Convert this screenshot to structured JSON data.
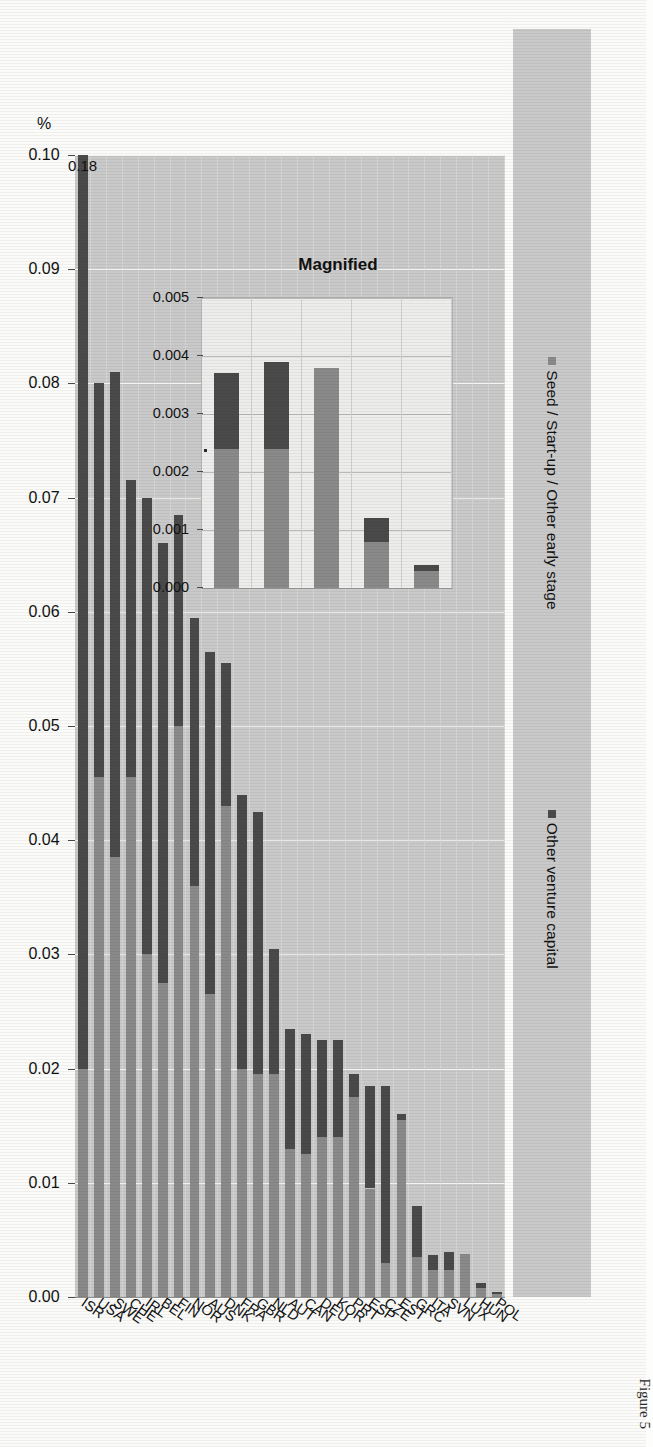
{
  "figure": {
    "caption": "Figure 5",
    "axis_unit_label": "%",
    "peak_annotation": "0.18"
  },
  "legend": {
    "items": [
      {
        "label": "Seed / Start-up / Other early stage",
        "color": "#8a8a8a",
        "key": "seed"
      },
      {
        "label": "Other venture capital",
        "color": "#4a4a4a",
        "key": "other"
      }
    ]
  },
  "inset": {
    "title": "Magnified"
  },
  "chart_data": {
    "type": "bar",
    "orientation": "horizontal-stacked",
    "title": "",
    "xlabel": "",
    "ylabel": "%",
    "ylim": [
      0.0,
      0.1
    ],
    "grid": true,
    "legend_position": "top",
    "tick_labels": [
      "0.10",
      "0.09",
      "0.08",
      "0.07",
      "0.06",
      "0.05",
      "0.04",
      "0.03",
      "0.02",
      "0.01",
      "0.00"
    ],
    "tick_values": [
      0.1,
      0.09,
      0.08,
      0.07,
      0.06,
      0.05,
      0.04,
      0.03,
      0.02,
      0.01,
      0.0
    ],
    "categories": [
      "ISR",
      "USA",
      "SWE",
      "CHE",
      "IRL",
      "BEL",
      "FIN",
      "NOR",
      "AUS",
      "DNK",
      "FRA",
      "GBR",
      "NLD",
      "AUT",
      "CAN",
      "DEU",
      "KOR",
      "PRT",
      "ESP",
      "CZE",
      "EST",
      "GRC",
      "ITA",
      "SVN",
      "LUX",
      "HUN",
      "POL"
    ],
    "series": [
      {
        "name": "Seed / Start-up / Other early stage",
        "color": "#8a8a8a",
        "values": [
          0.02,
          0.0455,
          0.0385,
          0.0455,
          0.03,
          0.0275,
          0.05,
          0.036,
          0.0265,
          0.043,
          0.02,
          0.0195,
          0.0195,
          0.013,
          0.0125,
          0.014,
          0.014,
          0.0175,
          0.0095,
          0.003,
          0.0155,
          0.0035,
          0.0024,
          0.0024,
          0.0038,
          0.0008,
          0.0003
        ]
      },
      {
        "name": "Other venture capital",
        "color": "#4a4a4a",
        "values": [
          0.16,
          0.0345,
          0.0425,
          0.026,
          0.04,
          0.0385,
          0.0185,
          0.0235,
          0.03,
          0.0125,
          0.024,
          0.023,
          0.011,
          0.0105,
          0.0105,
          0.0085,
          0.0085,
          0.002,
          0.009,
          0.0155,
          0.0005,
          0.0045,
          0.0013,
          0.0015,
          0.0,
          0.0004,
          0.0001
        ]
      }
    ],
    "annotations": [
      {
        "category": "ISR",
        "text": "0.18",
        "note": "bar truncated at axis maximum"
      }
    ]
  },
  "inset_chart_data": {
    "type": "bar",
    "orientation": "horizontal-stacked",
    "title": "Magnified",
    "xlim": [
      0.0,
      0.005
    ],
    "grid": true,
    "tick_labels": [
      "0.005",
      "0.004",
      "0.003",
      "0.002",
      "0.001",
      "0.000"
    ],
    "tick_values": [
      0.005,
      0.004,
      0.003,
      0.002,
      0.001,
      0.0
    ],
    "categories": [
      "ITA",
      "SVN",
      "LUX",
      "HUN",
      "POL"
    ],
    "series": [
      {
        "name": "Seed / Start-up / Other early stage",
        "color": "#8a8a8a",
        "values": [
          0.0024,
          0.0024,
          0.0038,
          0.0008,
          0.0003
        ]
      },
      {
        "name": "Other venture capital",
        "color": "#4a4a4a",
        "values": [
          0.0013,
          0.0015,
          0.0,
          0.0004,
          0.0001
        ]
      }
    ]
  }
}
